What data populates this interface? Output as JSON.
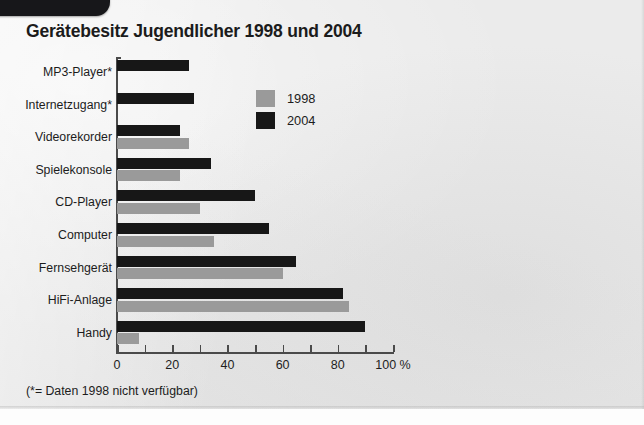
{
  "page": {
    "corner_tab": "black-rounded-tab"
  },
  "chart_data": {
    "type": "bar",
    "orientation": "horizontal",
    "title": "Gerätebesitz Jugendlicher 1998 und 2004",
    "xlabel": "",
    "ylabel": "",
    "xlim": [
      0,
      100
    ],
    "xticks": [
      0,
      20,
      40,
      60,
      80,
      100
    ],
    "xtick_labels": [
      "0",
      "20",
      "40",
      "60",
      "80",
      "100 %"
    ],
    "minor_tick_step": 10,
    "grid": false,
    "legend_position": "upper-center-inside",
    "categories": [
      "MP3-Player*",
      "Internetzugang*",
      "Videorekorder",
      "Spielekonsole",
      "CD-Player",
      "Computer",
      "Fernsehgerät",
      "HiFi-Anlage",
      "Handy"
    ],
    "series": [
      {
        "name": "1998",
        "color": "#9a9a9a",
        "values": [
          null,
          null,
          26,
          23,
          30,
          35,
          60,
          84,
          8
        ]
      },
      {
        "name": "2004",
        "color": "#171717",
        "values": [
          26,
          28,
          23,
          34,
          50,
          55,
          65,
          82,
          90
        ]
      }
    ],
    "annotation": "(*= Daten 1998 nicht verfügbar)"
  },
  "legend": {
    "items": [
      {
        "label": "1998",
        "color": "#9a9a9a"
      },
      {
        "label": "2004",
        "color": "#171717"
      }
    ]
  }
}
